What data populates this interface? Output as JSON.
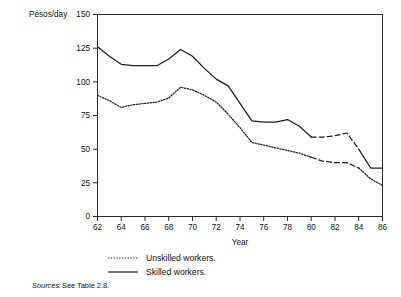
{
  "figure": {
    "background_color": "#ffffff",
    "ink_color": "#1d1d1d"
  },
  "chart_data": {
    "type": "line",
    "title": "",
    "xlabel": "Year",
    "ylabel": "Pesos/day",
    "xlim": [
      62,
      86
    ],
    "ylim": [
      0,
      150
    ],
    "grid": false,
    "legend_position": "below-axes",
    "x": [
      62,
      63,
      64,
      65,
      66,
      67,
      68,
      69,
      70,
      71,
      72,
      73,
      74,
      75,
      76,
      77,
      78,
      79,
      80,
      81,
      82,
      83,
      84,
      85,
      86
    ],
    "xticks": [
      62,
      64,
      66,
      68,
      70,
      72,
      74,
      76,
      78,
      80,
      82,
      84,
      86
    ],
    "yticks": [
      0,
      25,
      50,
      75,
      100,
      125,
      150
    ],
    "series": [
      {
        "name": "Skilled workers.",
        "style": "solid",
        "values": [
          126,
          119,
          113,
          112,
          112,
          112,
          117,
          124,
          119,
          110,
          102,
          97,
          84,
          71,
          70,
          70,
          72,
          67,
          59,
          59,
          60,
          62,
          50,
          36,
          36
        ]
      },
      {
        "name": "Unskilled workers.",
        "style": "dotted",
        "values": [
          90,
          86,
          81,
          83,
          84,
          85,
          88,
          96,
          94,
          90,
          85,
          76,
          66,
          55,
          53,
          51,
          49,
          47,
          44,
          41,
          40,
          40,
          36,
          28,
          23
        ]
      }
    ],
    "legend": [
      {
        "label": "Unskilled workers.",
        "style": "dotted"
      },
      {
        "label": "Skilled workers.",
        "style": "solid"
      }
    ]
  },
  "axis": {
    "y_axis_title": "Pesos/day",
    "x_axis_title": "Year",
    "y_tick_labels": [
      "150",
      "125",
      "100",
      "75",
      "50",
      "25",
      "0"
    ],
    "x_tick_labels": [
      "62",
      "64",
      "66",
      "68",
      "70",
      "72",
      "74",
      "76",
      "78",
      "80",
      "82",
      "84",
      "86"
    ]
  },
  "legend": {
    "unskilled_label": "Unskilled workers.",
    "skilled_label": "Skilled workers."
  },
  "footnote": {
    "label": "Sources:",
    "text": "See Table 2.8."
  }
}
